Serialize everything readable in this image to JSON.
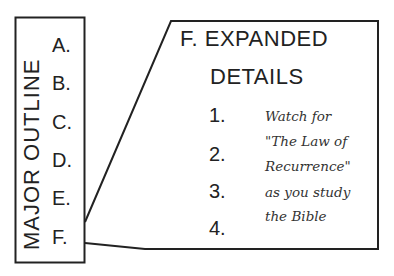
{
  "major_outline": {
    "title": "MAJOR OUTLINE",
    "items": [
      "A.",
      "B.",
      "C.",
      "D.",
      "E.",
      "F."
    ]
  },
  "expanded": {
    "heading_line1": "F. EXPANDED",
    "heading_line2": "DETAILS",
    "numbers": [
      "1.",
      "2.",
      "3.",
      "4."
    ],
    "note_lines": [
      "Watch for",
      "\"The Law of",
      "Recurrence\"",
      "as you study",
      "the Bible"
    ]
  }
}
